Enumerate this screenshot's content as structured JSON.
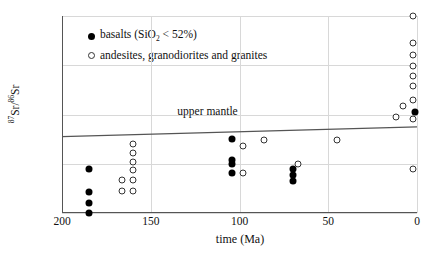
{
  "chart_data": {
    "type": "scatter",
    "title": "",
    "xlabel": "time (Ma)",
    "ylabel": "87Sr/86Sr",
    "ylabel_parts": {
      "sup1": "87",
      "mid": "Sr/",
      "sup2": "86",
      "end": "Sr"
    },
    "xlim": [
      200,
      0
    ],
    "ylim": [
      0.703,
      0.707
    ],
    "x_reversed": true,
    "grid": true,
    "xticks": [
      200,
      150,
      100,
      50,
      0
    ],
    "xtick_labels": [
      "200",
      "150",
      "100",
      "50",
      "0"
    ],
    "yticks": [
      0.703,
      0.704,
      0.705,
      0.706,
      0.707
    ],
    "ytick_labels": [
      "0.703",
      "0.704",
      "0.705",
      "0.706",
      "0.707"
    ],
    "legend_position": "top-left-inside",
    "series": [
      {
        "name": "basalts (SiO2 < 52%)",
        "marker": "filled-circle",
        "color": "#000000",
        "points": [
          {
            "x": 185,
            "y": 0.7039
          },
          {
            "x": 185,
            "y": 0.70342
          },
          {
            "x": 185,
            "y": 0.7032
          },
          {
            "x": 185,
            "y": 0.703
          },
          {
            "x": 104,
            "y": 0.7045
          },
          {
            "x": 104,
            "y": 0.70408
          },
          {
            "x": 104,
            "y": 0.704
          },
          {
            "x": 104,
            "y": 0.70382
          },
          {
            "x": 70,
            "y": 0.7039
          },
          {
            "x": 70,
            "y": 0.70378
          },
          {
            "x": 70,
            "y": 0.70364
          },
          {
            "x": 1,
            "y": 0.70505
          }
        ]
      },
      {
        "name": "andesites, granodiorites and granites",
        "marker": "open-circle",
        "color": "#333333",
        "points": [
          {
            "x": 160,
            "y": 0.7044
          },
          {
            "x": 160,
            "y": 0.70422
          },
          {
            "x": 160,
            "y": 0.70404
          },
          {
            "x": 160,
            "y": 0.70388
          },
          {
            "x": 160,
            "y": 0.70368
          },
          {
            "x": 160,
            "y": 0.70345
          },
          {
            "x": 166,
            "y": 0.70368
          },
          {
            "x": 166,
            "y": 0.70345
          },
          {
            "x": 98,
            "y": 0.70437
          },
          {
            "x": 98,
            "y": 0.70382
          },
          {
            "x": 86,
            "y": 0.70448
          },
          {
            "x": 67,
            "y": 0.704
          },
          {
            "x": 45,
            "y": 0.70448
          },
          {
            "x": 2,
            "y": 0.707
          },
          {
            "x": 2,
            "y": 0.70645
          },
          {
            "x": 2,
            "y": 0.7062
          },
          {
            "x": 2,
            "y": 0.70598
          },
          {
            "x": 2,
            "y": 0.70578
          },
          {
            "x": 2,
            "y": 0.70557
          },
          {
            "x": 2,
            "y": 0.7053
          },
          {
            "x": 2,
            "y": 0.7049
          },
          {
            "x": 8,
            "y": 0.70518
          },
          {
            "x": 12,
            "y": 0.70495
          },
          {
            "x": 2,
            "y": 0.7039
          }
        ]
      }
    ],
    "annotations": [
      {
        "name": "upper-mantle-line",
        "label": "upper mantle",
        "type": "line",
        "x_start": 200,
        "y_start": 0.70455,
        "x_end": 0,
        "y_end": 0.70475,
        "label_x": 118,
        "label_y": 0.70505,
        "color": "#555555"
      }
    ]
  }
}
